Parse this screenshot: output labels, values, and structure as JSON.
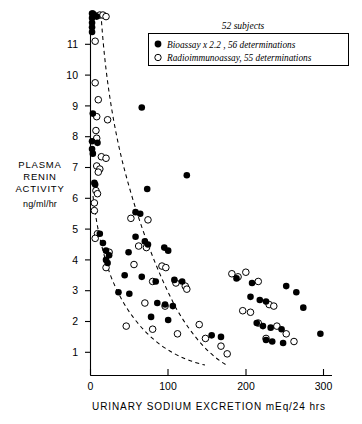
{
  "figure": {
    "caption_note": "52 subjects",
    "y_axis": {
      "title_lines": [
        "PLASMA",
        "RENIN",
        "ACTIVITY"
      ],
      "units": "ng/ml/hr"
    },
    "x_axis": {
      "title": "URINARY SODIUM EXCRETION  mEq/24 hrs"
    },
    "legend": {
      "items": [
        {
          "marker": "filled-circle-marker",
          "label": "Bioassay x 2.2 ,  56 determinations"
        },
        {
          "marker": "open-circle-marker",
          "label": "Radioimmunoassay,   55 determinations"
        }
      ]
    }
  },
  "chart_data": {
    "type": "scatter",
    "title": "",
    "subtitle": "52 subjects",
    "xlabel": "URINARY SODIUM EXCRETION  mEq/24 hrs",
    "ylabel": "PLASMA RENIN ACTIVITY  ng/ml/hr",
    "xlim": [
      0,
      320
    ],
    "ylim": [
      0,
      12
    ],
    "xticks": [
      0,
      100,
      200,
      300
    ],
    "xtick_labels": [
      "0",
      "100",
      "200",
      "300"
    ],
    "yticks": [
      1,
      2,
      3,
      4,
      5,
      6,
      7,
      8,
      9,
      10,
      11
    ],
    "ytick_labels": [
      "1",
      "2",
      "3",
      "4",
      "5",
      "6",
      "7",
      "8",
      "9",
      "10",
      "11"
    ],
    "grid": false,
    "legend_position": "top-right",
    "series": [
      {
        "name": "Bioassay x 2.2 ,  56 determinations",
        "marker": "filled-circle",
        "color": "#000000",
        "n_determinations": 56,
        "points": [
          [
            2,
            12.0
          ],
          [
            2,
            11.85
          ],
          [
            2,
            11.7
          ],
          [
            2,
            11.55
          ],
          [
            2,
            11.4
          ],
          [
            3,
            12.0
          ],
          [
            5,
            11.95
          ],
          [
            8,
            11.9
          ],
          [
            3,
            8.75
          ],
          [
            2,
            7.85
          ],
          [
            9,
            7.8
          ],
          [
            2,
            7.6
          ],
          [
            3,
            7.45
          ],
          [
            5,
            6.5
          ],
          [
            6,
            6.45
          ],
          [
            66,
            8.95
          ],
          [
            124,
            6.75
          ],
          [
            73,
            6.3
          ],
          [
            58,
            5.55
          ],
          [
            64,
            5.5
          ],
          [
            12,
            4.85
          ],
          [
            16,
            4.55
          ],
          [
            20,
            4.3
          ],
          [
            24,
            4.15
          ],
          [
            20,
            4.0
          ],
          [
            22,
            3.9
          ],
          [
            58,
            4.75
          ],
          [
            70,
            4.6
          ],
          [
            74,
            4.5
          ],
          [
            49,
            4.25
          ],
          [
            95,
            4.4
          ],
          [
            100,
            4.3
          ],
          [
            44,
            3.5
          ],
          [
            66,
            3.45
          ],
          [
            84,
            3.3
          ],
          [
            108,
            3.35
          ],
          [
            118,
            3.3
          ],
          [
            36,
            2.95
          ],
          [
            50,
            2.9
          ],
          [
            86,
            2.6
          ],
          [
            96,
            2.55
          ],
          [
            106,
            2.5
          ],
          [
            78,
            2.15
          ],
          [
            100,
            2.05
          ],
          [
            156,
            1.55
          ],
          [
            168,
            1.5
          ],
          [
            188,
            3.4
          ],
          [
            208,
            3.25
          ],
          [
            206,
            2.8
          ],
          [
            218,
            2.7
          ],
          [
            226,
            2.65
          ],
          [
            214,
            1.95
          ],
          [
            222,
            1.85
          ],
          [
            232,
            1.8
          ],
          [
            246,
            1.75
          ],
          [
            226,
            1.4
          ],
          [
            234,
            1.35
          ],
          [
            248,
            1.3
          ],
          [
            252,
            3.15
          ],
          [
            265,
            2.95
          ],
          [
            274,
            2.45
          ],
          [
            296,
            1.6
          ]
        ]
      },
      {
        "name": "Radioimmunoassay,   55 determinations",
        "marker": "open-circle",
        "color": "#000000",
        "n_determinations": 55,
        "points": [
          [
            12,
            11.95
          ],
          [
            16,
            11.95
          ],
          [
            20,
            11.9
          ],
          [
            6,
            11.1
          ],
          [
            6,
            9.75
          ],
          [
            10,
            9.2
          ],
          [
            8,
            8.65
          ],
          [
            22,
            8.55
          ],
          [
            7,
            8.2
          ],
          [
            8,
            7.95
          ],
          [
            14,
            7.35
          ],
          [
            20,
            7.3
          ],
          [
            8,
            7.05
          ],
          [
            12,
            6.95
          ],
          [
            10,
            6.85
          ],
          [
            7,
            6.25
          ],
          [
            9,
            6.15
          ],
          [
            5,
            5.85
          ],
          [
            5,
            5.6
          ],
          [
            9,
            4.85
          ],
          [
            6,
            4.7
          ],
          [
            24,
            4.25
          ],
          [
            20,
            3.75
          ],
          [
            52,
            5.35
          ],
          [
            74,
            5.3
          ],
          [
            62,
            4.45
          ],
          [
            72,
            4.4
          ],
          [
            56,
            3.85
          ],
          [
            92,
            3.8
          ],
          [
            97,
            3.75
          ],
          [
            80,
            3.3
          ],
          [
            110,
            3.25
          ],
          [
            122,
            3.15
          ],
          [
            124,
            3.05
          ],
          [
            70,
            2.6
          ],
          [
            96,
            2.5
          ],
          [
            46,
            1.85
          ],
          [
            80,
            1.75
          ],
          [
            112,
            1.6
          ],
          [
            140,
            1.9
          ],
          [
            148,
            1.45
          ],
          [
            168,
            1.2
          ],
          [
            176,
            0.95
          ],
          [
            182,
            3.55
          ],
          [
            190,
            3.45
          ],
          [
            200,
            3.6
          ],
          [
            216,
            3.3
          ],
          [
            196,
            2.35
          ],
          [
            206,
            2.3
          ],
          [
            230,
            2.55
          ],
          [
            236,
            2.5
          ],
          [
            216,
            1.95
          ],
          [
            240,
            1.85
          ],
          [
            226,
            1.45
          ],
          [
            252,
            1.6
          ],
          [
            262,
            1.35
          ]
        ]
      }
    ],
    "annotations": [
      {
        "name": "upper-envelope",
        "style": "dashed-curve",
        "description": "Upper dashed boundary curve of the data envelope"
      },
      {
        "name": "lower-envelope",
        "style": "dashed-curve",
        "description": "Lower dashed boundary curve of the data envelope"
      }
    ]
  }
}
